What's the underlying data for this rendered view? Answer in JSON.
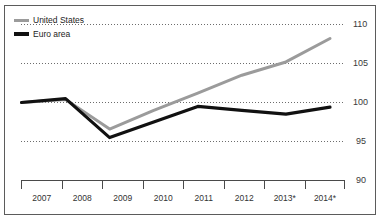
{
  "figure": {
    "clipped_top_text": "",
    "border_color": "#5b5b5b",
    "background": "#ffffff"
  },
  "legend": {
    "position": "top-left",
    "items": [
      {
        "label": "United States",
        "color": "#9b9b9b",
        "swatch": "line-swatch-gray"
      },
      {
        "label": "Euro area",
        "color": "#111111",
        "swatch": "line-swatch-black"
      }
    ]
  },
  "axes": {
    "y_ticks": [
      "110",
      "105",
      "100",
      "95",
      "90"
    ],
    "x_ticks": [
      "2007",
      "2008",
      "2009",
      "2010",
      "2011",
      "2012",
      "2013*",
      "2014*"
    ]
  },
  "chart_data": {
    "type": "line",
    "title": "",
    "subtitle": "",
    "xlabel": "",
    "ylabel": "",
    "x": [
      "2007",
      "2008",
      "2009",
      "2010",
      "2011",
      "2012",
      "2013*",
      "2014*"
    ],
    "categories": [
      "2007",
      "2008",
      "2009",
      "2010",
      "2011",
      "2012",
      "2013*",
      "2014*"
    ],
    "series": [
      {
        "name": "United States",
        "color": "#9b9b9b",
        "values": [
          100.0,
          100.4,
          96.6,
          99.0,
          101.2,
          103.5,
          105.2,
          108.2
        ]
      },
      {
        "name": "Euro area",
        "color": "#111111",
        "values": [
          100.0,
          100.5,
          95.5,
          97.5,
          99.5,
          99.0,
          98.5,
          99.4
        ]
      }
    ],
    "ylim": [
      90,
      110
    ],
    "y_tick_values": [
      110,
      105,
      100,
      95,
      90
    ],
    "grid": "horizontal-dotted",
    "grid_color": "#6d6d6d",
    "legend_position": "top-left",
    "annotations": [
      "* denotes forecast/estimate"
    ]
  }
}
